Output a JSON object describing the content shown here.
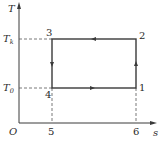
{
  "diagram": {
    "type": "T-s diagram (reverse Carnot cycle)",
    "axes": {
      "y_label": "T",
      "x_label": "s",
      "origin_label": "O"
    },
    "temperature_levels": [
      {
        "symbol": "T",
        "subscript": "k",
        "level": "high"
      },
      {
        "symbol": "T",
        "subscript": "0",
        "level": "low"
      }
    ],
    "points": [
      {
        "id": "1",
        "label": "1",
        "position": "bottom-right"
      },
      {
        "id": "2",
        "label": "2",
        "position": "top-right"
      },
      {
        "id": "3",
        "label": "3",
        "position": "top-left"
      },
      {
        "id": "4",
        "label": "4",
        "position": "bottom-left"
      },
      {
        "id": "5",
        "label": "5",
        "position": "x-axis below 4"
      },
      {
        "id": "6",
        "label": "6",
        "position": "x-axis below 1"
      }
    ],
    "processes": [
      {
        "from": "1",
        "to": "2",
        "direction": "up"
      },
      {
        "from": "2",
        "to": "3",
        "direction": "left"
      },
      {
        "from": "3",
        "to": "4",
        "direction": "down"
      },
      {
        "from": "4",
        "to": "1",
        "direction": "right"
      }
    ],
    "colors": {
      "line": "#3a3a3a",
      "dashed": "#555555"
    }
  }
}
